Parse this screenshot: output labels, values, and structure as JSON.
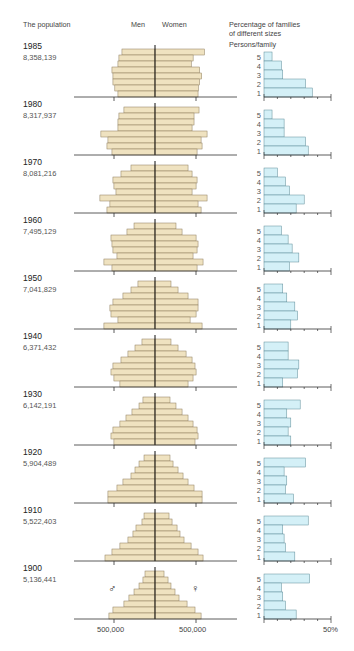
{
  "header": {
    "population_title": "The population",
    "men_label": "Men",
    "women_label": "Women",
    "families_title_line1": "Percentage of families",
    "families_title_line2": "of different sizes",
    "persons_label": "Persons/family"
  },
  "axis": {
    "men_tick_label": "500,000",
    "women_tick_label": "500,000",
    "family_tick_label": "50%"
  },
  "symbols": {
    "male": "♂",
    "female": "♀"
  },
  "colors": {
    "pyramid_fill": "#efe2c0",
    "pyramid_stroke": "#8a7a5a",
    "family_fill": "#d4f0f7",
    "family_stroke": "#5b8a96",
    "axis": "#333333"
  },
  "chart_data": {
    "type": "bar",
    "title": "The population",
    "pyramid_scale_tick": 500,
    "pyramid_units": "thousands",
    "family_xlim": [
      0,
      50
    ],
    "family_tick_step": 10,
    "family_categories": [
      "5",
      "4",
      "3",
      "2",
      "1"
    ],
    "years": [
      {
        "year": "1985",
        "population": "8,358,139",
        "men": [
          403,
          440,
          452,
          525,
          513,
          513,
          490,
          452
        ],
        "women": [
          603,
          465,
          442,
          544,
          569,
          544,
          530,
          525
        ],
        "family": {
          "5": 6,
          "4": 13,
          "3": 14,
          "2": 31,
          "1": 36
        }
      },
      {
        "year": "1980",
        "population": "8,317,937",
        "men": [
          379,
          440,
          452,
          452,
          660,
          574,
          586,
          525
        ],
        "women": [
          537,
          476,
          476,
          452,
          635,
          562,
          574,
          513
        ],
        "family": {
          "5": 6,
          "4": 15,
          "3": 15,
          "2": 31,
          "1": 33
        }
      },
      {
        "year": "1970",
        "population": "8,081,216",
        "men": [
          293,
          415,
          513,
          501,
          476,
          672,
          550,
          586
        ],
        "women": [
          403,
          452,
          513,
          501,
          452,
          635,
          525,
          562
        ],
        "family": {
          "5": 10,
          "4": 16,
          "3": 19,
          "2": 30,
          "1": 24
        }
      },
      {
        "year": "1960",
        "population": "7,495,129",
        "men": [
          256,
          342,
          537,
          525,
          513,
          464,
          623,
          525
        ],
        "women": [
          256,
          330,
          501,
          525,
          513,
          464,
          586,
          513
        ],
        "family": {
          "5": 13,
          "4": 18,
          "3": 21,
          "2": 26,
          "1": 19
        }
      },
      {
        "year": "1950",
        "population": "7,041,829",
        "men": [
          208,
          293,
          391,
          513,
          550,
          537,
          452,
          623
        ],
        "women": [
          195,
          281,
          403,
          525,
          525,
          501,
          428,
          574
        ],
        "family": {
          "5": 14,
          "4": 17,
          "3": 23,
          "2": 25,
          "1": 20
        }
      },
      {
        "year": "1940",
        "population": "6,371,432",
        "men": [
          159,
          244,
          330,
          415,
          513,
          537,
          501,
          428
        ],
        "women": [
          195,
          281,
          379,
          452,
          488,
          501,
          464,
          403
        ],
        "family": {
          "5": 18,
          "4": 18,
          "3": 26,
          "2": 25,
          "1": 14
        }
      },
      {
        "year": "1930",
        "population": "6,142,191",
        "men": [
          147,
          195,
          281,
          354,
          428,
          513,
          537,
          501
        ],
        "women": [
          183,
          256,
          330,
          403,
          464,
          513,
          525,
          488
        ],
        "family": {
          "5": 27,
          "4": 17,
          "3": 20,
          "2": 18,
          "1": 20
        }
      },
      {
        "year": "1920",
        "population": "5,904,489",
        "men": [
          134,
          195,
          244,
          293,
          391,
          464,
          574,
          574
        ],
        "women": [
          183,
          220,
          281,
          342,
          403,
          476,
          574,
          574
        ],
        "family": {
          "5": 31,
          "4": 15,
          "3": 17,
          "2": 16,
          "1": 22
        }
      },
      {
        "year": "1910",
        "population": "5,522,403",
        "men": [
          134,
          159,
          232,
          269,
          330,
          428,
          525,
          610
        ],
        "women": [
          171,
          208,
          269,
          305,
          354,
          440,
          525,
          586
        ],
        "family": {
          "5": 33,
          "4": 14,
          "3": 15,
          "2": 16,
          "1": 23
        }
      },
      {
        "year": "1900",
        "population": "5,136,441",
        "men": [
          122,
          147,
          195,
          256,
          318,
          379,
          513,
          562
        ],
        "women": [
          110,
          159,
          195,
          244,
          293,
          391,
          488,
          562
        ],
        "family": {
          "5": 34,
          "4": 13,
          "3": 14,
          "2": 16,
          "1": 24
        }
      }
    ]
  }
}
